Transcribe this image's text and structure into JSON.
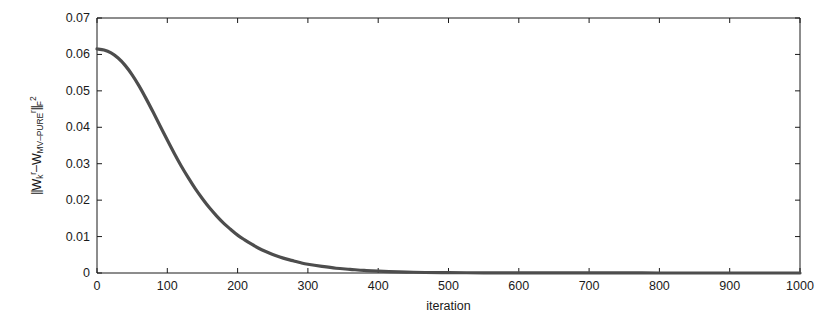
{
  "chart_data": {
    "type": "line",
    "title": "",
    "xlabel": "iteration",
    "ylabel": "||W_k^r - W_MV-PURE^r||_F^2",
    "ylabel_parts": {
      "open_bars": "||",
      "w1": "W",
      "w1_sub": "k",
      "w1_sup": "r",
      "minus": "–",
      "w2": "W",
      "w2_sub": "MV–PURE",
      "w2_sup": "r",
      "close_bars": "||",
      "close_sub": "F",
      "close_sup": "2"
    },
    "xlim": [
      0,
      1000
    ],
    "ylim": [
      0,
      0.07
    ],
    "xticks": [
      0,
      100,
      200,
      300,
      400,
      500,
      600,
      700,
      800,
      900,
      1000
    ],
    "xtick_labels": [
      "0",
      "100",
      "200",
      "300",
      "400",
      "500",
      "600",
      "700",
      "800",
      "900",
      "1000"
    ],
    "yticks": [
      0,
      0.01,
      0.02,
      0.03,
      0.04,
      0.05,
      0.06,
      0.07
    ],
    "ytick_labels": [
      "0",
      "0.01",
      "0.02",
      "0.03",
      "0.04",
      "0.05",
      "0.06",
      "0.07"
    ],
    "grid": false,
    "legend": false,
    "line_color": "#4d4d4d",
    "line_width": 3.2,
    "axis_color": "#1a1a1a",
    "background_color": "#ffffff",
    "series": [
      {
        "name": "convergence",
        "x": [
          0,
          10,
          20,
          30,
          40,
          50,
          60,
          70,
          80,
          90,
          100,
          110,
          120,
          130,
          140,
          150,
          160,
          170,
          180,
          190,
          200,
          210,
          220,
          230,
          240,
          250,
          260,
          270,
          280,
          290,
          300,
          320,
          340,
          360,
          380,
          400,
          450,
          500,
          550,
          600,
          650,
          700,
          750,
          800,
          850,
          900,
          950,
          1000
        ],
        "values": [
          0.0615,
          0.0612,
          0.0604,
          0.059,
          0.057,
          0.0544,
          0.0513,
          0.0478,
          0.0441,
          0.0403,
          0.0365,
          0.0328,
          0.0293,
          0.0261,
          0.0231,
          0.0204,
          0.0179,
          0.0157,
          0.0137,
          0.012,
          0.0104,
          0.0091,
          0.0079,
          0.0068,
          0.0059,
          0.0051,
          0.0044,
          0.0038,
          0.0033,
          0.0028,
          0.0024,
          0.0018,
          0.0013,
          0.001,
          0.0007,
          0.0005,
          0.0002,
          0.0001,
          6e-05,
          3e-05,
          2e-05,
          1e-05,
          1e-05,
          5e-06,
          3e-06,
          2e-06,
          1e-06,
          1e-06
        ]
      }
    ]
  },
  "plot_geometry": {
    "left": 97,
    "right": 800,
    "top": 18,
    "bottom": 273
  }
}
